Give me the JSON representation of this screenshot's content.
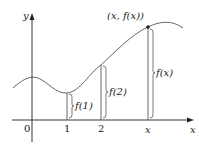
{
  "diagram": {
    "axes": {
      "x_label": "x",
      "y_label": "y",
      "origin_label": "0"
    },
    "ticks": [
      {
        "label": "1",
        "x": 67
      },
      {
        "label": "2",
        "x": 101
      },
      {
        "label": "x",
        "x": 148
      }
    ],
    "segments": [
      {
        "label": "f(1)"
      },
      {
        "label": "f(2)"
      },
      {
        "label": "f(x)"
      }
    ],
    "point_label": "(x, f(x))",
    "colors": {
      "curve": "#555555",
      "axis": "#222222",
      "point": "#222222"
    }
  }
}
